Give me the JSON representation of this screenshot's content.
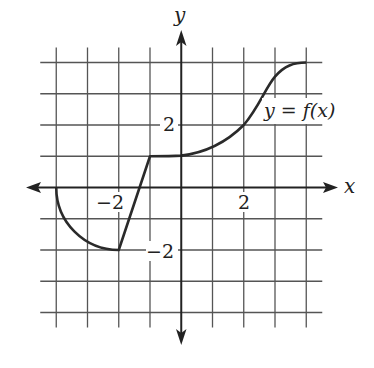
{
  "chart_data": {
    "type": "line",
    "title": "",
    "xlabel": "x",
    "ylabel": "y",
    "xlim": [
      -4,
      4
    ],
    "ylim": [
      -4,
      4
    ],
    "grid": true,
    "grid_step": 1,
    "x_tick_labels": [
      {
        "value": -2,
        "label": "−2"
      },
      {
        "value": 2,
        "label": "2"
      }
    ],
    "y_tick_labels": [
      {
        "value": 2,
        "label": "2"
      },
      {
        "value": -2,
        "label": "−2"
      }
    ],
    "series": [
      {
        "name": "y = f(x)",
        "segments": [
          {
            "kind": "quarter-circle arc",
            "from": [
              -4,
              0
            ],
            "to": [
              -2,
              -2
            ],
            "center": [
              -2,
              0
            ]
          },
          {
            "kind": "line",
            "from": [
              -2,
              -2
            ],
            "to": [
              -1,
              1
            ]
          },
          {
            "kind": "curve",
            "points": [
              [
                -1,
                1
              ],
              [
                0,
                1
              ],
              [
                1,
                1.3
              ],
              [
                2,
                2
              ],
              [
                3,
                3.6
              ],
              [
                4,
                4
              ]
            ]
          }
        ],
        "x": [
          -4,
          -3.4,
          -3,
          -2.5,
          -2,
          -1,
          0,
          1,
          2,
          2.5,
          3,
          3.5,
          4
        ],
        "y": [
          0,
          -1.2,
          -1.73,
          -1.94,
          -2,
          1,
          1,
          1.3,
          2,
          2.9,
          3.6,
          3.9,
          4
        ]
      }
    ],
    "annotations": [
      {
        "text": "y = f(x)",
        "at": [
          2.7,
          2.3
        ]
      }
    ]
  },
  "labels": {
    "x_axis": "x",
    "y_axis": "y",
    "curve_label": "y = f(x)",
    "tick_x_neg2": "−2",
    "tick_x_2": "2",
    "tick_y_2": "2",
    "tick_y_neg2": "−2"
  },
  "colors": {
    "grid": "#555555",
    "axis": "#222222",
    "curve": "#2a2a2a",
    "background": "#ffffff"
  }
}
